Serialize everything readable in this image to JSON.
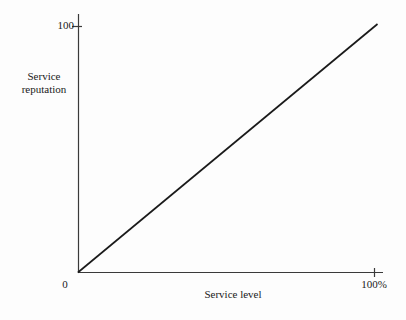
{
  "chart_data": {
    "type": "line",
    "title": "",
    "subtitle": "",
    "xlabel": "Service level",
    "ylabel": "Service reputation",
    "x": [
      0,
      100
    ],
    "values": [
      0,
      100
    ],
    "series": [
      {
        "name": "Service reputation vs service level",
        "values": [
          0,
          100
        ]
      }
    ],
    "xlim": [
      0,
      100
    ],
    "ylim": [
      0,
      100
    ],
    "x_tick_labels": [
      "0",
      "100%"
    ],
    "x_tick_values": [
      0,
      100
    ],
    "y_tick_labels": [
      "100"
    ],
    "y_tick_values": [
      100
    ],
    "origin_label": "0",
    "grid": false,
    "legend": false,
    "legend_position": "none",
    "annotations": [],
    "line_color": "#1a1a1a",
    "axis_color": "#3a3a3a",
    "background_color": "#fdfdfd"
  },
  "axes": {
    "y": {
      "label_line_1": "Service",
      "label_line_2": "reputation",
      "max_tick_label": "100"
    },
    "x": {
      "label": "Service level",
      "min_tick_label": "0",
      "max_tick_label": "100%"
    }
  }
}
